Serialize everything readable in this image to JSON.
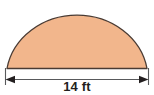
{
  "figure": {
    "name": "semicircle-with-diameter-dimension",
    "shape_label": "semicircle",
    "fill_color": "#f2b68c",
    "stroke_color": "#4a3b33",
    "background_color": "#ffffff",
    "dimension": {
      "label": "14 ft",
      "value": 14,
      "unit": "ft",
      "measures": "diameter",
      "line_color": "#58595b",
      "arrow_left": "left-arrowhead",
      "arrow_right": "right-arrowhead"
    },
    "geometry": {
      "center_x": 77,
      "baseline_y": 68.5,
      "radius_x": 71,
      "radius_y": 64,
      "dimension_line_y": 79.5,
      "extension_left_x": 5.5,
      "extension_right_x": 148.5,
      "extension_top_y": 68,
      "extension_bottom_y": 85
    }
  }
}
